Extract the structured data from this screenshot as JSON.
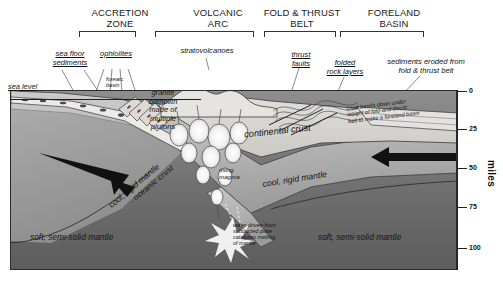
{
  "diagram": {
    "zones": [
      {
        "name": "accretion-zone",
        "label": "ACCRETION\nZONE",
        "left": 77,
        "width": 86,
        "bracket_left": 79,
        "bracket_width": 57
      },
      {
        "name": "volcanic-arc",
        "label": "VOLCANIC\nARC",
        "left": 168,
        "width": 104,
        "bracket_left": 155,
        "bracket_width": 99
      },
      {
        "name": "fold-and-thrust-belt",
        "label": "FOLD & THRUST\nBELT",
        "left": 258,
        "width": 92,
        "bracket_left": 264,
        "bracket_width": 72
      },
      {
        "name": "foreland-basin",
        "label": "FORELAND\nBASIN",
        "left": 352,
        "width": 88,
        "bracket_left": 340,
        "bracket_width": 84
      }
    ],
    "callouts": [
      {
        "name": "sea-floor-sediments",
        "label": "sea floor\nsediments",
        "x": 40,
        "y": 50,
        "w": 60,
        "underline": true
      },
      {
        "name": "ophiolites",
        "label": "ophiolites",
        "x": 92,
        "y": 50,
        "w": 48,
        "underline": true
      },
      {
        "name": "stratovolcanoes",
        "label": "stratovolcanoes",
        "x": 171,
        "y": 47,
        "w": 72,
        "underline": false
      },
      {
        "name": "thrust-faults",
        "label": "thrust\nfaults",
        "x": 284,
        "y": 51,
        "w": 34,
        "underline": true
      },
      {
        "name": "folded-rock-layers",
        "label": "folded\nrock layers",
        "x": 320,
        "y": 59,
        "w": 50,
        "underline": true
      },
      {
        "name": "sediments-eroded",
        "label": "sediments eroded from\nfold & thrust belt",
        "x": 374,
        "y": 58,
        "w": 102,
        "underline": false
      }
    ],
    "inner_labels": [
      {
        "name": "sea-level",
        "label": "sea level",
        "x": 8,
        "y": 83,
        "size": 7.4,
        "rotate": 0,
        "underline": true
      },
      {
        "name": "forearc-basin",
        "label": "forearc\nbasin",
        "x": 106,
        "y": 76,
        "size": 5.6,
        "rotate": 0,
        "underline": false
      },
      {
        "name": "granite-batholith",
        "label": "granite\nbatholith\nmade of\nmultiple\nplutons",
        "x": 139,
        "y": 89,
        "size": 7.6,
        "rotate": 0,
        "underline": false
      },
      {
        "name": "continental-crust",
        "label": "continental crust",
        "x": 244,
        "y": 126,
        "size": 9.2,
        "rotate": -6,
        "underline": false
      },
      {
        "name": "crust-bends-down",
        "label": "crust bends down under\nweight of fold-and-thrust\nbelt to make a foreland basin",
        "x": 347,
        "y": 101,
        "size": 5.6,
        "rotate": -7,
        "underline": false
      },
      {
        "name": "oceanic-crust",
        "label": "oceanic crust",
        "x": 132,
        "y": 196,
        "size": 7.8,
        "rotate": -40,
        "underline": false
      },
      {
        "name": "cool-rigid-mantle-left",
        "label": "cool, rigid mantle",
        "x": 107,
        "y": 203,
        "size": 8.4,
        "rotate": -40,
        "underline": false
      },
      {
        "name": "cool-rigid-mantle-right",
        "label": "cool, rigid mantle",
        "x": 262,
        "y": 180,
        "size": 8.6,
        "rotate": -9,
        "underline": false
      },
      {
        "name": "rising-magma",
        "label": "rising\nmagma",
        "x": 219,
        "y": 167,
        "size": 6.2,
        "rotate": 0,
        "underline": false
      },
      {
        "name": "water-driven",
        "label": "water driven from\nsubducted plate\ncatalyzes melting\nof mantle",
        "x": 233,
        "y": 222,
        "size": 5.5,
        "rotate": 0,
        "underline": false
      },
      {
        "name": "soft-semi-solid-mantle-left",
        "label": "soft, semi-solid mantle",
        "x": 30,
        "y": 233,
        "size": 8.4,
        "rotate": 0,
        "underline": false
      },
      {
        "name": "soft-semi-solid-mantle-right",
        "label": "soft, semi-solid mantle",
        "x": 318,
        "y": 233,
        "size": 8.4,
        "rotate": 0,
        "underline": false
      }
    ],
    "depth_axis": {
      "name": "depth-axis",
      "unit_label": "miles",
      "ticks": [
        {
          "value": "0",
          "y": 91
        },
        {
          "value": "25",
          "y": 129
        },
        {
          "value": "50",
          "y": 168
        },
        {
          "value": "75",
          "y": 207
        },
        {
          "value": "100",
          "y": 248
        }
      ]
    },
    "colors": {
      "ink": "#1a1a1a",
      "upper_mantle": "#b9b9b9",
      "lower_mantle": "#6d6d6d",
      "crust": "#d6d4d0",
      "slab": "#e8e6e2",
      "magma": "#ffffff"
    }
  }
}
